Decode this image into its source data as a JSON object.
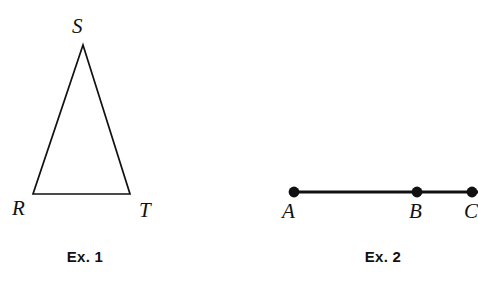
{
  "figure": {
    "background_color": "#ffffff",
    "stroke_color": "#111111",
    "exercises": [
      {
        "caption": "Ex. 1",
        "caption_x": 85,
        "caption_y": 249,
        "shape": "triangle",
        "vertices": [
          {
            "name": "S",
            "x": 83,
            "y": 45,
            "label": "S",
            "label_x": 72,
            "label_y": 16
          },
          {
            "name": "R",
            "x": 33,
            "y": 194,
            "label": "R",
            "label_x": 12,
            "label_y": 198
          },
          {
            "name": "T",
            "x": 130,
            "y": 194,
            "label": "T",
            "label_x": 139,
            "label_y": 200
          }
        ]
      },
      {
        "caption": "Ex. 2",
        "caption_x": 383,
        "caption_y": 249,
        "shape": "line-segment",
        "line": {
          "x1": 294,
          "y1": 192,
          "x2": 478,
          "y2": 192
        },
        "points": [
          {
            "name": "A",
            "x": 294,
            "y": 192,
            "label": "A",
            "label_x": 282,
            "label_y": 201
          },
          {
            "name": "B",
            "x": 417,
            "y": 192,
            "label": "B",
            "label_x": 409,
            "label_y": 201
          },
          {
            "name": "C",
            "x": 472,
            "y": 192,
            "label": "C",
            "label_x": 464,
            "label_y": 201
          }
        ]
      }
    ]
  }
}
